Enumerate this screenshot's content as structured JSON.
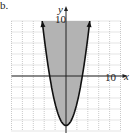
{
  "problem_label": "b.",
  "chart_data": {
    "type": "area",
    "title": "",
    "equation": "y = x^2 - 9",
    "inequality": "y >= x^2 - 9",
    "boundary": "solid",
    "shaded_region": "above curve",
    "xlabel": "x",
    "ylabel": "y",
    "xlim": [
      -10,
      10
    ],
    "ylim": [
      -10,
      10
    ],
    "x_tick_label": "10",
    "y_tick_label": "10",
    "grid": true,
    "grid_step": 2,
    "vertex": [
      0,
      -9
    ],
    "x_intercepts": [
      -3,
      3
    ],
    "points": [
      [
        -4.36,
        10
      ],
      [
        -4,
        7
      ],
      [
        -3,
        0
      ],
      [
        -2,
        -5
      ],
      [
        -1,
        -8
      ],
      [
        0,
        -9
      ],
      [
        1,
        -8
      ],
      [
        2,
        -5
      ],
      [
        3,
        0
      ],
      [
        4,
        7
      ],
      [
        4.36,
        10
      ]
    ]
  },
  "labels": {
    "y_axis": "y",
    "x_axis": "x",
    "y_max": "10",
    "x_max": "10"
  },
  "colors": {
    "shade": "#b3b3b3",
    "curve": "#111111",
    "grid": "#bdbdbd"
  }
}
